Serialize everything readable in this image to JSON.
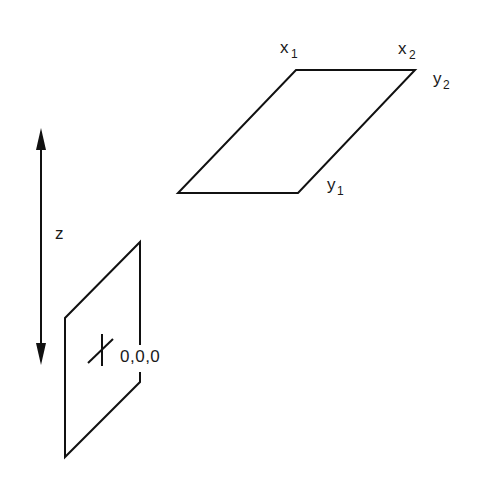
{
  "diagram": {
    "z_axis": {
      "label": "z",
      "direction": "bidirectional"
    },
    "origin_plane": {
      "origin_label": "0,0,0",
      "marker": "cross"
    },
    "target_plane": {
      "labels": {
        "x1": {
          "base": "x",
          "sub": "1"
        },
        "x2": {
          "base": "x",
          "sub": "2"
        },
        "y1": {
          "base": "y",
          "sub": "1"
        },
        "y2": {
          "base": "y",
          "sub": "2"
        }
      }
    },
    "colors": {
      "line": "#111111",
      "background": "#ffffff"
    }
  }
}
